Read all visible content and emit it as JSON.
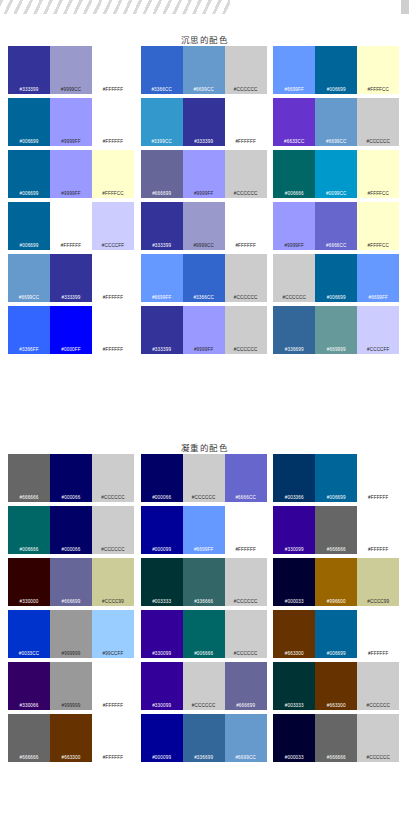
{
  "page": {
    "background": "#FFFFFF",
    "top_band": "decorative-diagonal-stripes"
  },
  "sections": [
    {
      "id": "contemplative",
      "title": "沉思的配色",
      "rows": [
        [
          {
            "colors": [
              "#333399",
              "#9999CC",
              "#FFFFFF"
            ]
          },
          {
            "colors": [
              "#3366CC",
              "#6699CC",
              "#CCCCCC"
            ]
          },
          {
            "colors": [
              "#6699FF",
              "#006699",
              "#FFFFCC"
            ]
          }
        ],
        [
          {
            "colors": [
              "#006699",
              "#9999FF",
              "#FFFFFF"
            ]
          },
          {
            "colors": [
              "#3399CC",
              "#333399",
              "#FFFFFF"
            ]
          },
          {
            "colors": [
              "#6633CC",
              "#6699CC",
              "#CCCCCC"
            ]
          }
        ],
        [
          {
            "colors": [
              "#006699",
              "#9999FF",
              "#FFFFCC"
            ]
          },
          {
            "colors": [
              "#666699",
              "#9999FF",
              "#CCCCCC"
            ]
          },
          {
            "colors": [
              "#006666",
              "#0099CC",
              "#FFFFCC"
            ]
          }
        ],
        [
          {
            "colors": [
              "#006699",
              "#FFFFFF",
              "#CCCCFF"
            ]
          },
          {
            "colors": [
              "#333399",
              "#9999CC",
              "#FFFFFF"
            ]
          },
          {
            "colors": [
              "#9999FF",
              "#6666CC",
              "#FFFFCC"
            ]
          }
        ],
        [
          {
            "colors": [
              "#6699CC",
              "#333399",
              "#FFFFFF"
            ]
          },
          {
            "colors": [
              "#6699FF",
              "#3366CC",
              "#CCCCCC"
            ]
          },
          {
            "colors": [
              "#CCCCCC",
              "#006699",
              "#6699FF"
            ]
          }
        ],
        [
          {
            "colors": [
              "#3366FF",
              "#0000FF",
              "#FFFFFF"
            ]
          },
          {
            "colors": [
              "#333399",
              "#9999FF",
              "#CCCCCC"
            ]
          },
          {
            "colors": [
              "#336699",
              "#669999",
              "#CCCCFF"
            ]
          }
        ]
      ]
    },
    {
      "id": "solemn",
      "title": "凝重的配色",
      "rows": [
        [
          {
            "colors": [
              "#666666",
              "#000066",
              "#CCCCCC"
            ]
          },
          {
            "colors": [
              "#000066",
              "#CCCCCC",
              "#6666CC"
            ]
          },
          {
            "colors": [
              "#003366",
              "#006699",
              "#FFFFFF"
            ]
          }
        ],
        [
          {
            "colors": [
              "#006666",
              "#000066",
              "#CCCCCC"
            ]
          },
          {
            "colors": [
              "#000099",
              "#6699FF",
              "#FFFFFF"
            ]
          },
          {
            "colors": [
              "#330099",
              "#666666",
              "#FFFFFF"
            ]
          }
        ],
        [
          {
            "colors": [
              "#330000",
              "#666699",
              "#CCCC99"
            ]
          },
          {
            "colors": [
              "#003333",
              "#336666",
              "#CCCCCC"
            ]
          },
          {
            "colors": [
              "#000033",
              "#996600",
              "#CCCC99"
            ]
          }
        ],
        [
          {
            "colors": [
              "#0033CC",
              "#999999",
              "#99CCFF"
            ]
          },
          {
            "colors": [
              "#330099",
              "#006666",
              "#CCCCCC"
            ]
          },
          {
            "colors": [
              "#663300",
              "#006699",
              "#FFFFFF"
            ]
          }
        ],
        [
          {
            "colors": [
              "#330066",
              "#999999",
              "#FFFFFF"
            ]
          },
          {
            "colors": [
              "#330099",
              "#CCCCCC",
              "#666699"
            ]
          },
          {
            "colors": [
              "#003333",
              "#663300",
              "#CCCCCC"
            ]
          }
        ],
        [
          {
            "colors": [
              "#666666",
              "#663300",
              "#FFFFFF"
            ]
          },
          {
            "colors": [
              "#000099",
              "#336699",
              "#6699CC"
            ]
          },
          {
            "colors": [
              "#000033",
              "#666666",
              "#CCCCCC"
            ]
          }
        ]
      ]
    }
  ]
}
